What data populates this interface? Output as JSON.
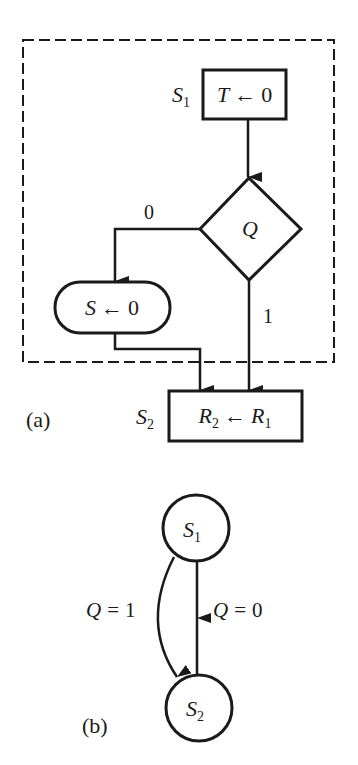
{
  "figure_a": {
    "caption": "(a)",
    "block": {
      "state_label": "S",
      "state_sub": "1",
      "state_box": {
        "var": "T",
        "arrow": "←",
        "value": "0"
      },
      "decision": {
        "var": "Q"
      },
      "branch_zero_label": "0",
      "branch_one_label": "1",
      "conditional_box": {
        "var": "S",
        "arrow": "←",
        "value": "0"
      }
    },
    "next_state": {
      "state_label": "S",
      "state_sub": "2",
      "box": {
        "lhs": "R",
        "lhs_sub": "2",
        "arrow": "←",
        "rhs": "R",
        "rhs_sub": "1"
      }
    }
  },
  "figure_b": {
    "caption": "(b)",
    "node_s1": {
      "label": "S",
      "sub": "1"
    },
    "node_s2": {
      "label": "S",
      "sub": "2"
    },
    "edge_q1": {
      "var": "Q",
      "eq": "=",
      "value": "1"
    },
    "edge_q0": {
      "var": "Q",
      "eq": "=",
      "value": "0"
    }
  },
  "colors": {
    "ink": "#1a1a1a",
    "background": "#ffffff"
  }
}
